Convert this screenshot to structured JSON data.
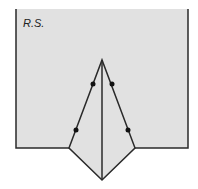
{
  "diagram": {
    "label": "R.S.",
    "colors": {
      "fill": "#e1e1e1",
      "stroke": "#2a2a2a",
      "background": "#ffffff"
    },
    "shapes": {
      "rectangle": {
        "x": 16,
        "y": 9,
        "width": 172,
        "height": 139
      },
      "pentagon": [
        [
          69,
          148
        ],
        [
          102,
          60
        ],
        [
          135,
          148
        ],
        [
          102,
          180
        ]
      ],
      "center_line": [
        [
          102,
          60
        ],
        [
          102,
          180
        ]
      ],
      "dots": [
        [
          93,
          84
        ],
        [
          112,
          84
        ],
        [
          76,
          130
        ],
        [
          128,
          130
        ]
      ]
    }
  }
}
